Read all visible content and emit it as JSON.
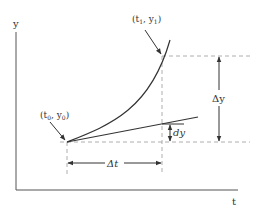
{
  "diagram": {
    "type": "derivative-vs-difference illustration",
    "axes": {
      "y_label": "y",
      "x_label": "t"
    },
    "points": {
      "start": {
        "label_t": "t",
        "label_t_sub": "0",
        "label_y": "y",
        "label_y_sub": "0",
        "label": "(t0, y0)"
      },
      "end": {
        "label_t": "t",
        "label_t_sub": "1",
        "label_y": "y",
        "label_y_sub": "1",
        "label": "(t1, y1)"
      }
    },
    "annotations": {
      "delta_t": "Δt",
      "delta_y": "Δy",
      "dy": "dy"
    },
    "colors": {
      "line": "#333333",
      "dashed": "#9a9a9a",
      "axis": "#555555"
    }
  }
}
